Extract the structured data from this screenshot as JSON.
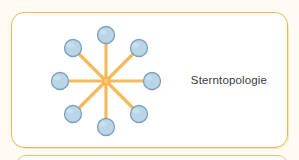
{
  "page": {
    "background_color": "#fdfbf4"
  },
  "panel": {
    "border_color": "#f0b450",
    "fill_color": "#ffffff",
    "caption": "Sterntopologie"
  },
  "panel_next": {
    "border_color": "#f2c173",
    "fill_color": "#ffffff"
  },
  "diagram": {
    "name": "star-topology",
    "type": "network-topology",
    "hub": {
      "label": "",
      "x": 105,
      "y": 80,
      "color": "#f5b64f"
    },
    "node_fill": "#b9d6e8",
    "node_stroke": "#7f9fb8",
    "node_radius": 8.5,
    "spoke_color": "#f4ba5c",
    "spoke_width": 3.2,
    "ring_radius": 46,
    "nodes": [
      {
        "id": "node-n",
        "angle_deg": 270,
        "x": 105,
        "y": 34
      },
      {
        "id": "node-ne",
        "angle_deg": 315,
        "x": 138,
        "y": 47
      },
      {
        "id": "node-e",
        "angle_deg": 0,
        "x": 151,
        "y": 80
      },
      {
        "id": "node-se",
        "angle_deg": 45,
        "x": 138,
        "y": 113
      },
      {
        "id": "node-s",
        "angle_deg": 90,
        "x": 105,
        "y": 126
      },
      {
        "id": "node-sw",
        "angle_deg": 135,
        "x": 72,
        "y": 113
      },
      {
        "id": "node-w",
        "angle_deg": 180,
        "x": 59,
        "y": 80
      },
      {
        "id": "node-nw",
        "angle_deg": 225,
        "x": 72,
        "y": 47
      }
    ]
  }
}
